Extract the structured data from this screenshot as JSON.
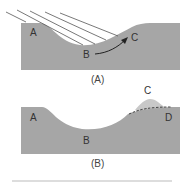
{
  "figure": {
    "panel_a": {
      "caption": "(A)",
      "labels": {
        "a": "A",
        "b": "B",
        "c": "C"
      },
      "colors": {
        "terrain": "#a6a6a6",
        "lines": "#555555",
        "arrow": "#222222"
      }
    },
    "panel_b": {
      "caption": "(B)",
      "labels": {
        "a": "A",
        "b": "B",
        "c": "C",
        "d": "D"
      },
      "colors": {
        "terrain": "#a6a6a6",
        "bump": "#c8c8c8",
        "dashed": "#333333"
      }
    },
    "divider_color": "#bbbbbb"
  }
}
